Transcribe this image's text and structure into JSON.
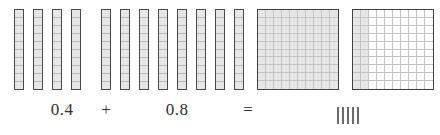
{
  "problem": {
    "type": "decimal-addition-area-model",
    "addend_1": "0.4",
    "operator_plus": "+",
    "addend_2": "0.8",
    "operator_equals": "=",
    "answer_placeholder": "||||"
  },
  "model": {
    "tenths_strip_segments": 10,
    "group_1": {
      "name": "tenths-strips-0-4",
      "strip_count": 4,
      "value": "0.4",
      "shaded_segments_per_strip": 10
    },
    "group_2": {
      "name": "tenths-strips-0-8",
      "strip_count": 8,
      "value": "0.8",
      "shaded_segments_per_strip": 10
    },
    "grids": [
      {
        "name": "hundred-grid-full",
        "rows": 10,
        "columns": 10,
        "shaded_columns": 10,
        "value": "1.0"
      },
      {
        "name": "hundred-grid-two-tenths",
        "rows": 10,
        "columns": 10,
        "shaded_columns": 2,
        "value": "0.2"
      }
    ]
  },
  "colors": {
    "shaded_fill": "#e6e6e6",
    "unshaded_fill": "#ffffff",
    "grid_line": "#c2c2c2",
    "outline": "#404040",
    "strip_outline": "#4a4a4a",
    "text": "#2f2f2f",
    "hatch": "#6b6b6b",
    "background": "#ffffff"
  },
  "layout": {
    "width": 440,
    "height": 135
  }
}
